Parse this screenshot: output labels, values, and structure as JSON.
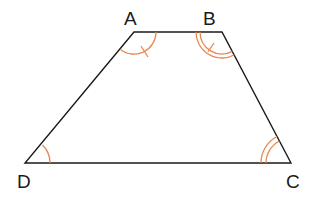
{
  "diagram": {
    "type": "trapezium",
    "colors": {
      "edge": "#1a1a1a",
      "angle_mark": "#e8874f"
    },
    "vertices": [
      {
        "label": "A",
        "x": 134,
        "y": 32,
        "label_x": 124,
        "label_y": 25
      },
      {
        "label": "B",
        "x": 222,
        "y": 32,
        "label_x": 203,
        "label_y": 25
      },
      {
        "label": "C",
        "x": 291,
        "y": 163,
        "label_x": 286,
        "label_y": 188
      },
      {
        "label": "D",
        "x": 25,
        "y": 163,
        "label_x": 17,
        "label_y": 188
      }
    ],
    "edges": [
      [
        "A",
        "B"
      ],
      [
        "B",
        "C"
      ],
      [
        "C",
        "D"
      ],
      [
        "D",
        "A"
      ]
    ],
    "angle_marks": [
      {
        "vertex": "A",
        "style": "single arc with tick"
      },
      {
        "vertex": "B",
        "style": "double arc with tick"
      },
      {
        "vertex": "C",
        "style": "double arc"
      },
      {
        "vertex": "D",
        "style": "single arc"
      }
    ]
  }
}
